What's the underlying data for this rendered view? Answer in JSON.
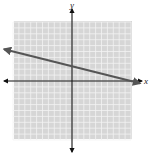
{
  "chart_data": {
    "type": "line",
    "title": "",
    "xlabel": "x",
    "ylabel": "y",
    "xlim": [
      -10,
      10
    ],
    "ylim": [
      -10,
      10
    ],
    "grid": true,
    "legend": null,
    "series": [
      {
        "name": "line",
        "equation": "y = -0.25x + 2.5",
        "slope": -0.25,
        "intercept": 2.5,
        "x": [
          -11.5,
          11.5
        ],
        "y": [
          5.375,
          -0.375
        ],
        "color": "#555555"
      }
    ]
  },
  "labels": {
    "x_axis": "x",
    "y_axis": "y"
  },
  "colors": {
    "grid_bg": "#d6d6d6",
    "grid_line": "#f2f2f2",
    "axis": "#111111",
    "line": "#555555"
  }
}
